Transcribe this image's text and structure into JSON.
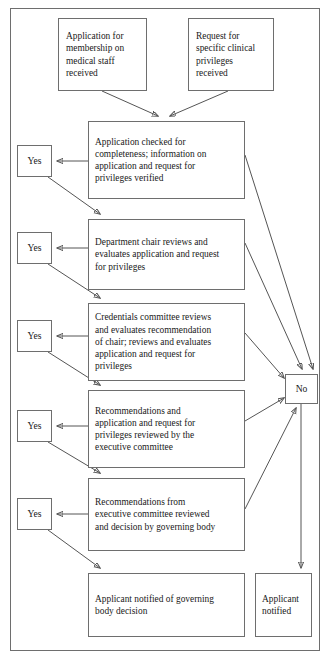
{
  "figure": {
    "clipped_header_left": "",
    "clipped_header_right": ""
  },
  "nodes": {
    "start_application": {
      "id": "start-application",
      "label": "Application for\nmembership on\nmedical staff\nreceived",
      "x": 58,
      "y": 18,
      "w": 89,
      "h": 73
    },
    "start_request": {
      "id": "start-request",
      "label": "Request for\nspecific clinical\nprivileges\nreceived",
      "x": 188,
      "y": 18,
      "w": 86,
      "h": 73
    },
    "step_1": {
      "id": "step-completeness-check",
      "label": "Application checked for\ncompleteness; information on\napplication and request for\nprivileges verified",
      "x": 88,
      "y": 121,
      "w": 157,
      "h": 78
    },
    "step_2": {
      "id": "step-department-chair-review",
      "label": "Department chair reviews and\nevaluates application and request\nfor privileges",
      "x": 88,
      "y": 219,
      "w": 157,
      "h": 71
    },
    "step_3": {
      "id": "step-credentials-committee-review",
      "label": "Credentials committee reviews\nand evaluates recommendation\nof chair; reviews and evaluates\napplication and request for\nprivileges",
      "x": 88,
      "y": 303,
      "w": 157,
      "h": 78
    },
    "step_4": {
      "id": "step-executive-committee-review",
      "label": "Recommendations and\napplication and request for\nprivileges reviewed by the\nexecutive committee",
      "x": 88,
      "y": 390,
      "w": 157,
      "h": 78
    },
    "step_5": {
      "id": "step-governing-body-decision",
      "label": "Recommendations from\nexecutive committee reviewed\nand decision by governing body",
      "x": 88,
      "y": 478,
      "w": 157,
      "h": 73
    },
    "end_notified_decision": {
      "id": "end-applicant-notified-decision",
      "label": "Applicant notified of governing\nbody decision",
      "x": 88,
      "y": 573,
      "w": 157,
      "h": 64
    },
    "end_notified": {
      "id": "end-applicant-notified",
      "label": "Applicant\nnotified",
      "x": 255,
      "y": 573,
      "w": 57,
      "h": 64
    },
    "no_node": {
      "id": "decision-no",
      "label": "No",
      "x": 285,
      "y": 374,
      "w": 33,
      "h": 30
    }
  },
  "yes_nodes": [
    {
      "id": "decision-yes-1",
      "label": "Yes",
      "x": 17,
      "y": 145,
      "w": 35,
      "h": 32
    },
    {
      "id": "decision-yes-2",
      "label": "Yes",
      "x": 17,
      "y": 232,
      "w": 35,
      "h": 32
    },
    {
      "id": "decision-yes-3",
      "label": "Yes",
      "x": 17,
      "y": 320,
      "w": 35,
      "h": 32
    },
    {
      "id": "decision-yes-4",
      "label": "Yes",
      "x": 17,
      "y": 410,
      "w": 35,
      "h": 32
    },
    {
      "id": "decision-yes-5",
      "label": "Yes",
      "x": 17,
      "y": 498,
      "w": 35,
      "h": 32
    }
  ],
  "colors": {
    "stroke": "#555555",
    "box_border": "#6e6e6e",
    "background": "#ffffff",
    "text": "#1a1a1a"
  }
}
